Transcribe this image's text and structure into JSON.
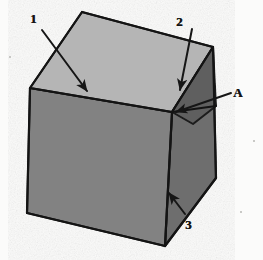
{
  "figure": {
    "background_color": "#fbfbfa",
    "line_color": "#1c1c1c",
    "faces": {
      "top_face_color": "#b5b5b5",
      "front_left_face_color": "#828282",
      "right_face_color": "#6e6e6e",
      "wedge_face_color": "#5e5e5e"
    }
  },
  "callouts": [
    {
      "id": "callout-1",
      "label": "1",
      "label_x": 30,
      "label_y": 12,
      "arrow_from_x": 42,
      "arrow_from_y": 30,
      "arrow_to_x": 91,
      "arrow_to_y": 96,
      "points_to": "top-face"
    },
    {
      "id": "callout-2",
      "label": "2",
      "label_x": 176,
      "label_y": 15,
      "arrow_from_x": 192,
      "arrow_from_y": 29,
      "arrow_to_x": 179,
      "arrow_to_y": 95,
      "points_to": "wedge-face"
    },
    {
      "id": "callout-a",
      "label": "A",
      "label_x": 233,
      "label_y": 86,
      "arrow_from_x": 230,
      "arrow_from_y": 94,
      "arrow_to_x": 172,
      "arrow_to_y": 114,
      "points_to": "vertex-a"
    },
    {
      "id": "callout-3",
      "label": "3",
      "label_x": 185,
      "label_y": 218,
      "arrow_from_x": 185,
      "arrow_from_y": 214,
      "arrow_to_x": 166,
      "arrow_to_y": 189,
      "points_to": "right-face"
    }
  ],
  "geometry": {
    "top_face_points": "82,12 213,47 172,112 30,88",
    "front_left_face_points": "30,88 172,112 165,246 27,213",
    "right_face_points": "172,112 213,47 216,178 165,246",
    "wedge_face_points": "172,112 213,47 216,104 196,121",
    "top_back_edge": "82,12 213,47",
    "top_left_edge": "82,12 30,88",
    "top_front_left_edge": "30,88 172,112",
    "top_front_right_edge": "172,112 213,47",
    "left_vertical_edge": "30,88 27,213",
    "bottom_front_edge": "27,213 165,246",
    "center_vertical_edge": "172,112 165,246",
    "right_outer_edge": "213,47 216,178 165,246"
  },
  "specks": [
    {
      "x": 240,
      "y": 211,
      "size": 2
    },
    {
      "x": 9,
      "y": 56,
      "size": 2
    },
    {
      "x": 253,
      "y": 140,
      "size": 2
    }
  ]
}
